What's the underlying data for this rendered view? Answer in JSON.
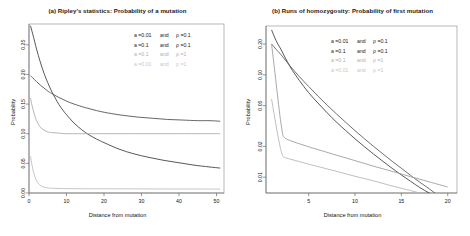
{
  "figure": {
    "background": "#ffffff",
    "width": 470,
    "height": 236
  },
  "panel_a": {
    "title": "(a) Ripley's statistics: Probability of a mutation",
    "xlabel": "Distance from mutation",
    "ylabel": "Probability",
    "legend": [
      {
        "a": "a =0.01",
        "and": "and",
        "rho": "ρ =0.1",
        "color": "#1a1a1a"
      },
      {
        "a": "a =0.1",
        "and": "and",
        "rho": "ρ =0.1",
        "color": "#1a1a1a"
      },
      {
        "a": "a =0.1",
        "and": "and",
        "rho": "ρ =1",
        "color": "#b0b0b0"
      },
      {
        "a": "a =0.01",
        "and": "and",
        "rho": "ρ =1",
        "color": "#c8c8c8"
      }
    ]
  },
  "panel_b": {
    "title": "(b) Runs of homozygosity: Probability of first mutation",
    "xlabel": "Distance from mutation",
    "ylabel": "Probability",
    "legend": [
      {
        "a": "a =0.01",
        "and": "and",
        "rho": "ρ =0.1",
        "color": "#1a1a1a"
      },
      {
        "a": "a =0.1",
        "and": "and",
        "rho": "ρ =0.1",
        "color": "#1a1a1a"
      },
      {
        "a": "a =0.1",
        "and": "and",
        "rho": "ρ =1",
        "color": "#b0b0b0"
      },
      {
        "a": "a =0.01",
        "and": "and",
        "rho": "ρ =1",
        "color": "#c8c8c8"
      }
    ]
  },
  "chart_data": [
    {
      "type": "line",
      "panel": "a",
      "title": "(a) Ripley's statistics: Probability of a mutation",
      "xlabel": "Distance from mutation",
      "ylabel": "Probability",
      "xlim": [
        0,
        52
      ],
      "ylim": [
        0.0,
        0.285
      ],
      "xticks": [
        0,
        10,
        20,
        30,
        40,
        50
      ],
      "yticks": [
        0.0,
        0.05,
        0.1,
        0.15,
        0.2,
        0.25
      ],
      "ytick_labels": [
        "0.00",
        "0.05",
        "0.10",
        "0.15",
        "0.20",
        "0.25"
      ],
      "xtick_labels": [
        "0",
        "10",
        "20",
        "30",
        "40",
        "50"
      ],
      "grid": false,
      "yscale": "linear",
      "legend_position": "top-right",
      "series": [
        {
          "name": "a =0.01 and ρ =0.1",
          "color": "#3a3a3a",
          "x": [
            0.4,
            1,
            2,
            3,
            4,
            5,
            6,
            7,
            8,
            9,
            10,
            12,
            14,
            16,
            18,
            20,
            24,
            28,
            32,
            36,
            40,
            44,
            48,
            51
          ],
          "y": [
            0.282,
            0.268,
            0.243,
            0.221,
            0.202,
            0.186,
            0.172,
            0.16,
            0.149,
            0.14,
            0.132,
            0.118,
            0.107,
            0.098,
            0.091,
            0.085,
            0.074,
            0.066,
            0.06,
            0.055,
            0.051,
            0.047,
            0.044,
            0.042
          ]
        },
        {
          "name": "a =0.1 and ρ =0.1",
          "color": "#4a4a4a",
          "x": [
            0.4,
            1,
            2,
            3,
            4,
            5,
            6,
            8,
            10,
            12,
            15,
            18,
            21,
            25,
            29,
            33,
            37,
            41,
            45,
            48,
            51
          ],
          "y": [
            0.198,
            0.194,
            0.188,
            0.182,
            0.177,
            0.172,
            0.168,
            0.161,
            0.155,
            0.15,
            0.144,
            0.139,
            0.135,
            0.131,
            0.128,
            0.126,
            0.124,
            0.123,
            0.122,
            0.122,
            0.121
          ]
        },
        {
          "name": "a =0.1 and ρ =1",
          "color": "#a8a8a8",
          "x": [
            0.4,
            0.8,
            1.2,
            1.6,
            2,
            2.5,
            3,
            3.5,
            4,
            5,
            6,
            8,
            10,
            14,
            18,
            24,
            30,
            38,
            45,
            51
          ],
          "y": [
            0.16,
            0.148,
            0.138,
            0.129,
            0.122,
            0.116,
            0.111,
            0.108,
            0.106,
            0.103,
            0.102,
            0.101,
            0.1,
            0.1,
            0.1,
            0.1,
            0.1,
            0.1,
            0.1,
            0.1
          ]
        },
        {
          "name": "a =0.01 and ρ =1",
          "color": "#bcbcbc",
          "x": [
            0.4,
            0.8,
            1.2,
            1.6,
            2,
            2.5,
            3,
            3.5,
            4,
            5,
            6,
            8,
            10,
            14,
            18,
            24,
            30,
            38,
            45,
            51
          ],
          "y": [
            0.062,
            0.047,
            0.035,
            0.027,
            0.021,
            0.016,
            0.013,
            0.011,
            0.0098,
            0.0085,
            0.008,
            0.0076,
            0.0074,
            0.0072,
            0.0071,
            0.007,
            0.0069,
            0.0068,
            0.0067,
            0.0066
          ]
        }
      ]
    },
    {
      "type": "line",
      "panel": "b",
      "title": "(b) Runs of homozygosity: Probability of first mutation",
      "xlabel": "Distance from mutation",
      "ylabel": "Probability",
      "xlim": [
        0.4,
        21
      ],
      "ylim": [
        0.007,
        0.3
      ],
      "xticks": [
        5,
        10,
        15,
        20
      ],
      "yticks": [
        0.01,
        0.02,
        0.05,
        0.1,
        0.2
      ],
      "ytick_labels": [
        "0.01",
        "0.02",
        "0.05",
        "0.10",
        "0.20"
      ],
      "xtick_labels": [
        "5",
        "10",
        "15",
        "20"
      ],
      "grid": false,
      "yscale": "log",
      "legend_position": "top-right",
      "series": [
        {
          "name": "a =0.01 and ρ =0.1",
          "color": "#3a3a3a",
          "x": [
            1,
            1.5,
            2,
            3,
            4,
            5,
            6,
            7,
            8,
            9,
            10,
            11,
            12,
            13,
            14,
            15,
            16,
            17,
            18,
            19,
            20
          ],
          "y": [
            0.275,
            0.215,
            0.178,
            0.12,
            0.088,
            0.067,
            0.053,
            0.0425,
            0.0345,
            0.0285,
            0.0237,
            0.0199,
            0.0168,
            0.0143,
            0.0122,
            0.0105,
            0.0091,
            0.0079,
            0.007,
            0.0062,
            0.0055
          ]
        },
        {
          "name": "a =0.1 and ρ =0.1",
          "color": "#555555",
          "x": [
            1,
            1.5,
            2,
            3,
            4,
            5,
            6,
            7,
            8,
            9,
            10,
            11,
            12,
            13,
            14,
            15,
            16,
            17,
            18,
            19,
            20
          ],
          "y": [
            0.2,
            0.177,
            0.158,
            0.122,
            0.096,
            0.077,
            0.062,
            0.0505,
            0.0415,
            0.0343,
            0.0285,
            0.0238,
            0.02,
            0.0169,
            0.0143,
            0.0122,
            0.0104,
            0.0089,
            0.0077,
            0.0066,
            0.0058
          ]
        },
        {
          "name": "a =0.1 and ρ =1",
          "color": "#9a9a9a",
          "x": [
            1,
            1.3,
            1.6,
            1.9,
            2.1,
            2.3,
            3,
            4,
            5,
            6,
            8,
            10,
            12,
            14,
            16,
            18,
            20
          ],
          "y": [
            0.2,
            0.118,
            0.068,
            0.04,
            0.03,
            0.0248,
            0.0228,
            0.0212,
            0.0198,
            0.0186,
            0.0164,
            0.0145,
            0.0128,
            0.0114,
            0.0101,
            0.009,
            0.008
          ]
        },
        {
          "name": "a =0.01 and ρ =1",
          "color": "#b4b4b4",
          "x": [
            1,
            1.3,
            1.6,
            1.9,
            2.1,
            2.3,
            3,
            4,
            5,
            6,
            8,
            10,
            12,
            14,
            16,
            18,
            20
          ],
          "y": [
            0.058,
            0.04,
            0.028,
            0.0202,
            0.0172,
            0.0158,
            0.015,
            0.0142,
            0.0134,
            0.0127,
            0.0114,
            0.0102,
            0.0092,
            0.0082,
            0.0074,
            0.0066,
            0.0059
          ]
        }
      ]
    }
  ]
}
